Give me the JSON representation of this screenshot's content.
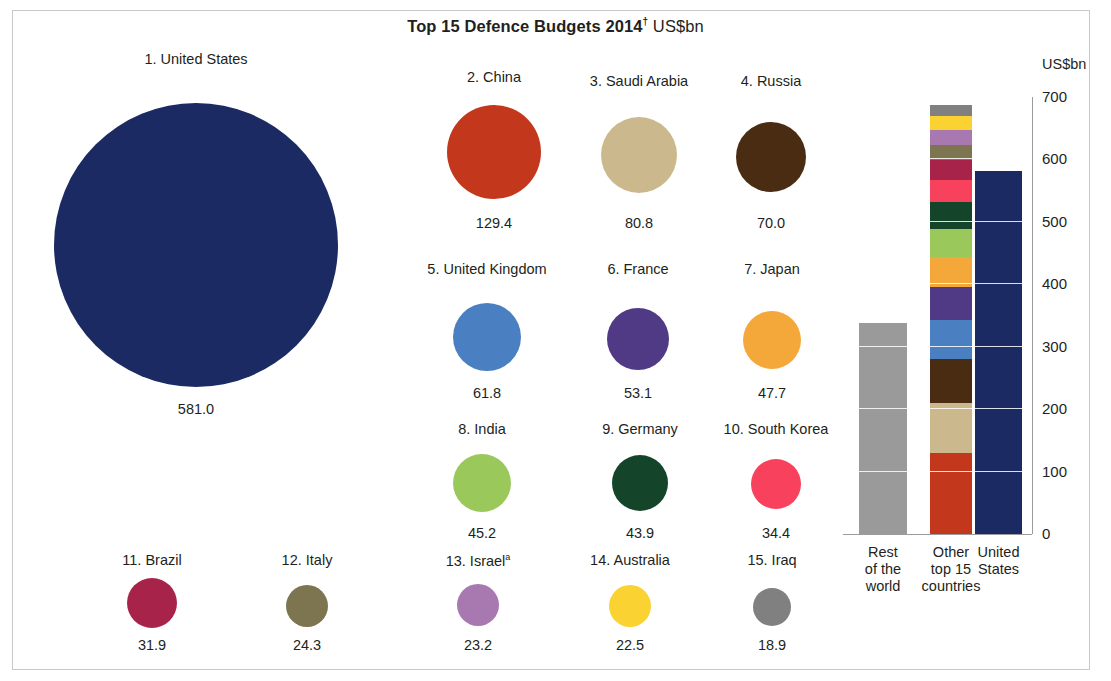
{
  "title": {
    "bold": "Top 15 Defence Budgets 2014",
    "superscript": "†",
    "regular": "US$bn"
  },
  "chart_data": {
    "type": "bar",
    "subtitle": "",
    "xlabel": "",
    "ylabel": "US$bn",
    "ylim": [
      0,
      700
    ],
    "yticks": [
      "0",
      "100",
      "200",
      "300",
      "400",
      "500",
      "600",
      "700"
    ],
    "grid": true,
    "legend_position": "none",
    "unit": "US$bn",
    "bubbles": [
      {
        "rank": "1",
        "label": "1. United States",
        "country": "United States",
        "value": "581.0",
        "number": 581.0,
        "color": "#1b2a62"
      },
      {
        "rank": "2",
        "label": "2. China",
        "country": "China",
        "value": "129.4",
        "number": 129.4,
        "color": "#c3371d"
      },
      {
        "rank": "3",
        "label": "3. Saudi Arabia",
        "country": "Saudi Arabia",
        "value": "80.8",
        "number": 80.8,
        "color": "#cbb98d"
      },
      {
        "rank": "4",
        "label": "4. Russia",
        "country": "Russia",
        "value": "70.0",
        "number": 70.0,
        "color": "#4a2c12"
      },
      {
        "rank": "5",
        "label": "5. United Kingdom",
        "country": "United Kingdom",
        "value": "61.8",
        "number": 61.8,
        "color": "#4a80c2"
      },
      {
        "rank": "6",
        "label": "6. France",
        "country": "France",
        "value": "53.1",
        "number": 53.1,
        "color": "#503a86"
      },
      {
        "rank": "7",
        "label": "7. Japan",
        "country": "Japan",
        "value": "47.7",
        "number": 47.7,
        "color": "#f5a83a"
      },
      {
        "rank": "8",
        "label": "8. India",
        "country": "India",
        "value": "45.2",
        "number": 45.2,
        "color": "#9ac85a"
      },
      {
        "rank": "9",
        "label": "9. Germany",
        "country": "Germany",
        "value": "43.9",
        "number": 43.9,
        "color": "#14452a"
      },
      {
        "rank": "10",
        "label": "10. South Korea",
        "country": "South Korea",
        "value": "34.4",
        "number": 34.4,
        "color": "#f8415c"
      },
      {
        "rank": "11",
        "label": "11. Brazil",
        "country": "Brazil",
        "value": "31.9",
        "number": 31.9,
        "color": "#a8234a"
      },
      {
        "rank": "12",
        "label": "12. Italy",
        "country": "Italy",
        "value": "24.3",
        "number": 24.3,
        "color": "#7c7550"
      },
      {
        "rank": "13",
        "label": "13. Israel",
        "country": "Israel",
        "value": "23.2",
        "number": 23.2,
        "color": "#a878b0",
        "footnote": "a"
      },
      {
        "rank": "14",
        "label": "14. Australia",
        "country": "Australia",
        "value": "22.5",
        "number": 22.5,
        "color": "#fad232"
      },
      {
        "rank": "15",
        "label": "15. Iraq",
        "country": "Iraq",
        "value": "18.9",
        "number": 18.9,
        "color": "#808080"
      }
    ],
    "categories": [
      "Rest of the world",
      "Other top 15 countries",
      "United States"
    ],
    "bars": [
      {
        "name": "rest-of-the-world",
        "caption": "Rest\nof the\nworld",
        "total": 337,
        "color": "#9a9a9a",
        "stacked": false
      },
      {
        "name": "other-top-15-countries",
        "caption": "Other\ntop 15\ncountries",
        "total": 687,
        "stacked": true,
        "segments": [
          {
            "country": "China",
            "value": 129.4,
            "color": "#c3371d"
          },
          {
            "country": "Saudi Arabia",
            "value": 80.8,
            "color": "#cbb98d"
          },
          {
            "country": "Russia",
            "value": 70.0,
            "color": "#4a2c12"
          },
          {
            "country": "United Kingdom",
            "value": 61.8,
            "color": "#4a80c2"
          },
          {
            "country": "France",
            "value": 53.1,
            "color": "#503a86"
          },
          {
            "country": "Japan",
            "value": 47.7,
            "color": "#f5a83a"
          },
          {
            "country": "India",
            "value": 45.2,
            "color": "#9ac85a"
          },
          {
            "country": "Germany",
            "value": 43.9,
            "color": "#14452a"
          },
          {
            "country": "South Korea",
            "value": 34.4,
            "color": "#f8415c"
          },
          {
            "country": "Brazil",
            "value": 31.9,
            "color": "#a8234a"
          },
          {
            "country": "Italy",
            "value": 24.3,
            "color": "#7c7550"
          },
          {
            "country": "Israel",
            "value": 23.2,
            "color": "#a878b0"
          },
          {
            "country": "Australia",
            "value": 22.5,
            "color": "#fad232"
          },
          {
            "country": "Iraq",
            "value": 18.9,
            "color": "#808080"
          }
        ]
      },
      {
        "name": "united-states",
        "caption": "United\nStates",
        "total": 581.0,
        "color": "#1b2a62",
        "stacked": false
      }
    ]
  },
  "axis": {
    "unit_label": "US$bn",
    "ticks": [
      "700",
      "600",
      "500",
      "400",
      "300",
      "200",
      "100",
      "0"
    ]
  },
  "captions": {
    "bar0": "Rest\nof the\nworld",
    "bar1": "Other\ntop 15\ncountries",
    "bar2": "United\nStates"
  },
  "layout": {
    "bubbles": [
      {
        "cx": 196,
        "cy": 245,
        "r": 142,
        "label_y": 51,
        "value_y": 401
      },
      {
        "cx": 494,
        "cy": 152,
        "r": 47,
        "label_y": 69,
        "value_y": 215
      },
      {
        "cx": 639,
        "cy": 155,
        "r": 38,
        "label_y": 73,
        "value_y": 215
      },
      {
        "cx": 771,
        "cy": 157,
        "r": 35,
        "label_y": 73,
        "value_y": 215
      },
      {
        "cx": 487,
        "cy": 337,
        "r": 34,
        "label_y": 261,
        "value_y": 385
      },
      {
        "cx": 638,
        "cy": 339,
        "r": 31,
        "label_y": 261,
        "value_y": 385
      },
      {
        "cx": 772,
        "cy": 340,
        "r": 29,
        "label_y": 261,
        "value_y": 385
      },
      {
        "cx": 482,
        "cy": 483,
        "r": 29,
        "label_y": 421,
        "value_y": 525
      },
      {
        "cx": 640,
        "cy": 483,
        "r": 28,
        "label_y": 421,
        "value_y": 525
      },
      {
        "cx": 776,
        "cy": 484,
        "r": 25,
        "label_y": 421,
        "value_y": 525
      },
      {
        "cx": 152,
        "cy": 603,
        "r": 25,
        "label_y": 552,
        "value_y": 637
      },
      {
        "cx": 307,
        "cy": 606,
        "r": 21,
        "label_y": 552,
        "value_y": 637
      },
      {
        "cx": 478,
        "cy": 605,
        "r": 21,
        "label_y": 552,
        "value_y": 637
      },
      {
        "cx": 630,
        "cy": 606,
        "r": 21,
        "label_y": 552,
        "value_y": 637
      },
      {
        "cx": 772,
        "cy": 607,
        "r": 19,
        "label_y": 552,
        "value_y": 637
      }
    ],
    "chart": {
      "baseline_y": 534,
      "top_y": 97,
      "px_per_100": 62.5,
      "bars": [
        {
          "x": 859,
          "w": 48
        },
        {
          "x": 930,
          "w": 42
        },
        {
          "x": 975,
          "w": 47
        }
      ],
      "axis_x": 1032,
      "tick_label_x": 1042,
      "unit_x": 1042,
      "unit_y": 56
    }
  }
}
